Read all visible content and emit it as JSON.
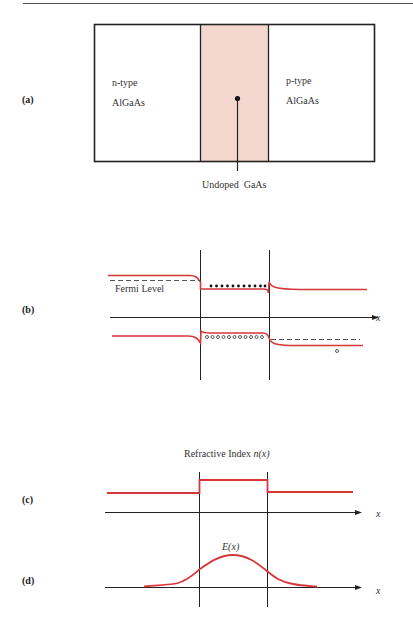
{
  "colors": {
    "curve": "#d8373a",
    "line": "#222222",
    "active_region": "#f3d7ce",
    "rule": "#555555"
  },
  "panels": {
    "a": {
      "label": "(a)",
      "left_region": {
        "line1": "n-type",
        "line2": "AlGaAs"
      },
      "right_region": {
        "line1": "p-type",
        "line2": "AlGaAs"
      },
      "center_callout": "Undoped  GaAs"
    },
    "b": {
      "label": "(b)",
      "fermi_label": "Fermi Level",
      "axis_label": "x",
      "electron_count": 12,
      "hole_count": 12
    },
    "c": {
      "label": "(c)",
      "title_prefix": "Refractive Index ",
      "title_var": "n(x)",
      "axis_label": "x"
    },
    "d": {
      "label": "(d)",
      "curve_label": "E(x)",
      "axis_label": "x"
    }
  }
}
